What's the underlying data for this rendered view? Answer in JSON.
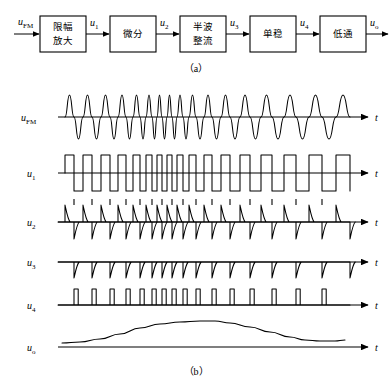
{
  "figure": {
    "title_semantic": "FM pulse-counting discriminator block diagram and waveforms",
    "caption_a": "（a）",
    "caption_b": "（b）"
  },
  "block_diagram": {
    "input_label": {
      "base": "u",
      "sub": "FM"
    },
    "output_label": {
      "base": "u",
      "sub": "o"
    },
    "blocks": [
      {
        "id": "limiter-amplifier",
        "line1": "限幅",
        "line2": "放大",
        "x": 40,
        "y": 16,
        "w": 46,
        "h": 36
      },
      {
        "id": "differentiator",
        "line1": "微分",
        "line2": "",
        "x": 110,
        "y": 16,
        "w": 46,
        "h": 36
      },
      {
        "id": "half-wave-rectifier",
        "line1": "半波",
        "line2": "整流",
        "x": 180,
        "y": 16,
        "w": 46,
        "h": 36
      },
      {
        "id": "monostable",
        "line1": "单稳",
        "line2": "",
        "x": 250,
        "y": 16,
        "w": 46,
        "h": 36
      },
      {
        "id": "low-pass-filter",
        "line1": "低通",
        "line2": "",
        "x": 320,
        "y": 16,
        "w": 46,
        "h": 36
      }
    ],
    "interstage_labels": [
      {
        "id": "u1",
        "base": "u",
        "sub": "1",
        "x": 94,
        "y": 22
      },
      {
        "id": "u2",
        "base": "u",
        "sub": "2",
        "x": 164,
        "y": 22
      },
      {
        "id": "u3",
        "base": "u",
        "sub": "3",
        "x": 234,
        "y": 22
      },
      {
        "id": "u4",
        "base": "u",
        "sub": "4",
        "x": 304,
        "y": 22
      }
    ]
  },
  "waveforms": {
    "axis_label": "t",
    "rows": [
      {
        "id": "ufm",
        "base": "u",
        "sub": "FM",
        "sub_italic": false,
        "baseline": 117,
        "label_x": 21,
        "label_y": 121
      },
      {
        "id": "u1",
        "base": "u",
        "sub": "1",
        "sub_italic": false,
        "baseline": 173,
        "label_x": 27,
        "label_y": 177
      },
      {
        "id": "u2",
        "base": "u",
        "sub": "2",
        "sub_italic": false,
        "baseline": 222,
        "label_x": 27,
        "label_y": 226
      },
      {
        "id": "u3",
        "base": "u",
        "sub": "3",
        "sub_italic": false,
        "baseline": 262,
        "label_x": 27,
        "label_y": 266
      },
      {
        "id": "u4",
        "base": "u",
        "sub": "4",
        "sub_italic": false,
        "baseline": 305,
        "label_x": 27,
        "label_y": 309
      },
      {
        "id": "uo",
        "base": "u",
        "sub": "o",
        "sub_italic": false,
        "baseline": 347,
        "label_x": 27,
        "label_y": 351
      }
    ]
  },
  "chart_data": {
    "type": "line",
    "xlabel": "t",
    "ylabel": "",
    "axis_x_start": 58,
    "axis_x_end": 352,
    "series": [
      {
        "name": "u_FM",
        "description": "Frequency-modulated carrier, constant amplitude, instantaneous frequency rises to a maximum near mid-span then falls",
        "amplitude": 22,
        "zero_crossings": [
          65,
          74,
          83,
          92,
          101,
          110,
          118,
          126,
          133,
          140,
          146,
          152,
          157,
          162,
          167,
          172,
          177,
          183,
          189,
          196,
          204,
          212,
          221,
          230,
          240,
          250,
          261,
          272,
          284,
          296,
          309,
          322,
          336,
          350
        ]
      },
      {
        "name": "u_1",
        "description": "Limited/amplified bipolar square wave; edges coincide with u_FM zero crossings",
        "high": 18,
        "low": -18,
        "edges": [
          65,
          74,
          83,
          92,
          101,
          110,
          118,
          126,
          133,
          140,
          146,
          152,
          157,
          162,
          167,
          172,
          177,
          183,
          189,
          196,
          204,
          212,
          221,
          230,
          240,
          250,
          261,
          272,
          284,
          296,
          309,
          322,
          336,
          350
        ]
      },
      {
        "name": "u_2",
        "description": "Differentiated square wave: alternating positive and negative exponentially decaying spikes at every edge",
        "spike_up": 17,
        "spike_down": 17,
        "positive_spikes": [
          65,
          83,
          101,
          118,
          133,
          146,
          157,
          167,
          177,
          189,
          204,
          221,
          240,
          261,
          284,
          309,
          336
        ],
        "negative_spikes": [
          74,
          92,
          110,
          126,
          140,
          152,
          162,
          172,
          183,
          196,
          212,
          230,
          250,
          272,
          296,
          322,
          350
        ]
      },
      {
        "name": "u_3",
        "description": "Half-wave rectified spikes: only the negative-going spikes remain",
        "spike_down": 16,
        "negative_spikes": [
          74,
          92,
          110,
          126,
          140,
          152,
          162,
          172,
          183,
          196,
          212,
          230,
          250,
          272,
          296,
          322,
          350
        ]
      },
      {
        "name": "u_4",
        "description": "Monostable output: pulses of constant width and amplitude, one per negative spike; pulse density follows instantaneous frequency",
        "pulse_height": 16,
        "pulse_width": 4.2,
        "pulse_starts": [
          74,
          92,
          110,
          126,
          140,
          152,
          162,
          172,
          183,
          196,
          212,
          230,
          250,
          272,
          296,
          322
        ]
      },
      {
        "name": "u_o",
        "description": "Low-pass filtered average of u_4: smooth bell-shaped recovered modulating signal",
        "peak_height": 26,
        "peak_x": 205,
        "points": [
          [
            62,
            4
          ],
          [
            80,
            5
          ],
          [
            100,
            8
          ],
          [
            120,
            13
          ],
          [
            140,
            19
          ],
          [
            160,
            23
          ],
          [
            180,
            25
          ],
          [
            200,
            26
          ],
          [
            215,
            26
          ],
          [
            230,
            24
          ],
          [
            250,
            20
          ],
          [
            270,
            15
          ],
          [
            290,
            10
          ],
          [
            305,
            7
          ],
          [
            320,
            6
          ],
          [
            335,
            6
          ],
          [
            345,
            7
          ]
        ]
      }
    ]
  }
}
